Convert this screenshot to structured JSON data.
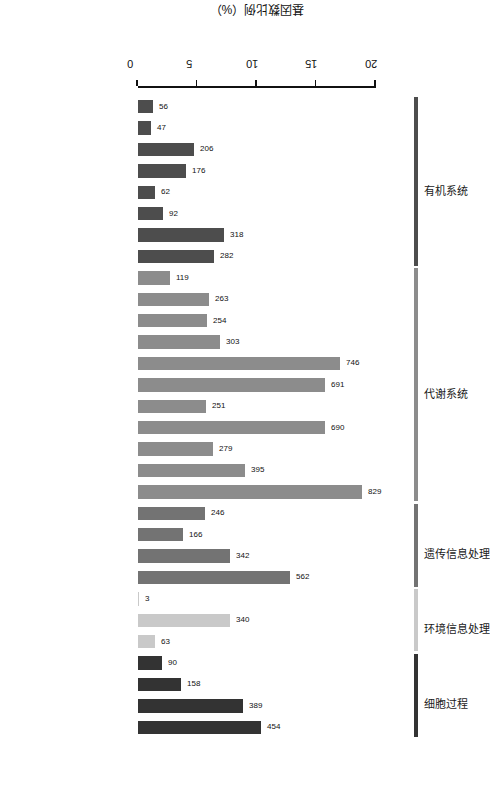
{
  "chart_data": {
    "type": "bar",
    "title": "",
    "xlabel": "",
    "ylabel": "基因数比例（%）",
    "ylim": [
      0,
      20
    ],
    "yticks": [
      0,
      5,
      10,
      15,
      20
    ],
    "grid": false,
    "legend_position": "top-ribbons",
    "value_axis_unit": "%",
    "total_genes": 4400,
    "categories": [
      "Excretory System",
      "Sensory System",
      "Nervous System",
      "Environmental Adaptation",
      "Development",
      "Circulatory System",
      "Immune System",
      "Endocrine System",
      "Glycan Biosynthesis and Metabolism",
      "Metabolism of Other Amino Acids",
      "Xenobiotics Biodegradation and Metabolism",
      "Metabolism of Terpenoids and Polyketides",
      "Amino Acid Metabolism",
      "Biosynthesis of Other Secondary Metabolites",
      "Nucleotide Metabolism",
      "Energy Metabolism",
      "Metabolism of Cofactors and Vitamins",
      "Lipid Metabolism",
      "Carbohydrate Metabolism",
      "Replication and Repair",
      "Transcription",
      "Folding, Sorting and Degradation",
      "Translation",
      "Signaling Molecules and Interaction",
      "Signal Transduction",
      "Membrane Transport",
      "Cell Motility",
      "Cell Communication",
      "Transport and Catabolism",
      "Cell Growth and Death"
    ],
    "values": [
      56,
      47,
      206,
      176,
      62,
      92,
      318,
      282,
      119,
      263,
      254,
      303,
      746,
      691,
      251,
      690,
      279,
      395,
      829,
      246,
      166,
      342,
      562,
      3,
      340,
      63,
      90,
      158,
      389,
      454
    ],
    "percents": [
      1.27,
      1.07,
      4.68,
      4.0,
      1.41,
      2.09,
      7.23,
      6.41,
      2.7,
      5.98,
      5.77,
      6.89,
      16.95,
      15.7,
      5.7,
      15.68,
      6.34,
      8.98,
      18.84,
      5.59,
      3.77,
      7.77,
      12.77,
      0.07,
      7.73,
      1.43,
      2.05,
      3.59,
      8.84,
      10.32
    ],
    "groups": [
      {
        "label": "有机系统",
        "color": "#4d4d4d",
        "start": 0,
        "end": 7
      },
      {
        "label": "代谢系统",
        "color": "#8c8c8c",
        "start": 8,
        "end": 18
      },
      {
        "label": "遗传信息处理",
        "color": "#737373",
        "start": 19,
        "end": 22
      },
      {
        "label": "环境信息处理",
        "color": "#c9c9c9",
        "start": 23,
        "end": 25
      },
      {
        "label": "细胞过程",
        "color": "#333333",
        "start": 26,
        "end": 29
      }
    ]
  }
}
